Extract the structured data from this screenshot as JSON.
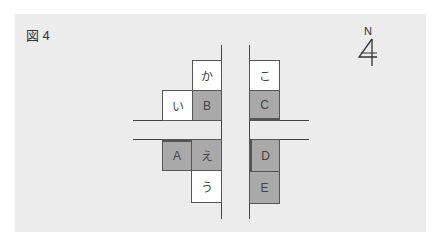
{
  "figure": {
    "label": "図 4"
  },
  "compass": {
    "letter": "N",
    "icon": "north-arrow-icon"
  },
  "colors": {
    "background": "#ececec",
    "gray_box": "#a9a9a9",
    "white_box": "#ffffff",
    "line": "#444444"
  },
  "blocks": {
    "ka": "か",
    "i": "い",
    "B": "B",
    "ko": "こ",
    "C": "C",
    "A": "A",
    "e": "え",
    "u": "う",
    "D": "D",
    "E": "E"
  }
}
